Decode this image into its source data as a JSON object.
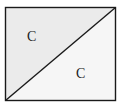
{
  "diagram": {
    "shape": "rectangle divided by diagonal",
    "rect": {
      "x": 5.5,
      "y": 7.5,
      "width": 110,
      "height": 93
    },
    "diagonal": {
      "from": "bottom-left",
      "to": "top-right"
    },
    "colors": {
      "stroke": "#1a1a1a",
      "upper_left_fill": "#ebebeb",
      "lower_right_fill": "#f6f6f6",
      "background": "#ffffff"
    },
    "regions": [
      {
        "name": "upper-left-triangle",
        "label": "C"
      },
      {
        "name": "lower-right-triangle",
        "label": "C"
      }
    ]
  }
}
